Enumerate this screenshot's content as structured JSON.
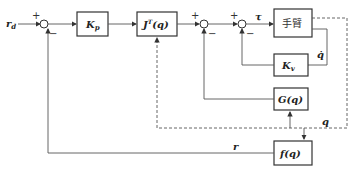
{
  "diagram": {
    "type": "control-block-diagram",
    "input_label": "r_d",
    "blocks": {
      "kp": "K_p",
      "jt": "J^T(q)",
      "arm": "手臂",
      "kv": "K_v",
      "g": "G(q)",
      "f": "f(q)"
    },
    "signals": {
      "tau": "τ",
      "qdot": "q̇",
      "q": "q",
      "r": "r"
    },
    "signs": {
      "plus": "+",
      "minus": "−"
    }
  }
}
